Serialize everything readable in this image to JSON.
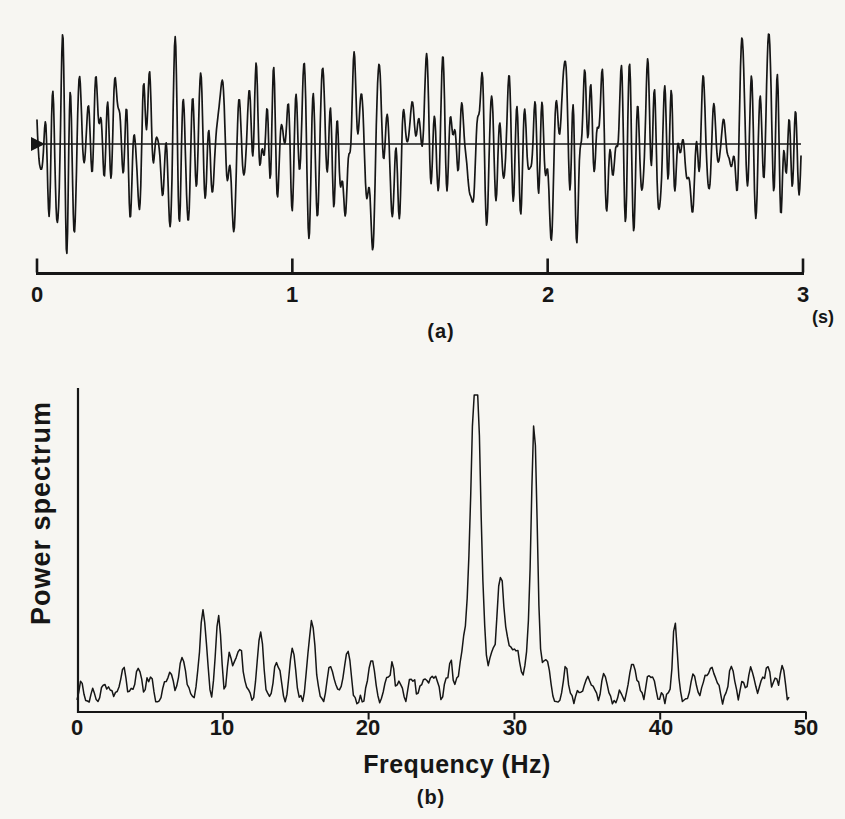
{
  "figure": {
    "bg_color": "#f7f6f2",
    "ink_color": "#161616"
  },
  "panel_a": {
    "caption": "(a)",
    "axis": {
      "unit_label": "(s)",
      "tick_labels": [
        "0",
        "1",
        "2",
        "3"
      ]
    }
  },
  "panel_b": {
    "caption": "(b)",
    "xlabel": "Frequency (Hz)",
    "ylabel": "Power spectrum",
    "tick_labels": [
      "0",
      "10",
      "20",
      "30",
      "40",
      "50"
    ]
  },
  "chart_data": [
    {
      "id": "time-signal",
      "type": "line",
      "title": "",
      "xlabel": "(s)",
      "ylabel": "",
      "xlim": [
        0,
        3
      ],
      "xticks": [
        0,
        1,
        2,
        3
      ],
      "grid": false,
      "description": "Dense zero-mean noisy oscillatory trace (EEG-like raw signal) drawn about a horizontal baseline with a small solid start arrowhead at t=0; duration 3 s",
      "synthesis": {
        "seed": 1234567,
        "peak_abs_px": 110,
        "components": [
          {
            "f": 27.35,
            "a": 1.0
          },
          {
            "f": 31.35,
            "a": 0.85
          },
          {
            "f": 29.15,
            "a": 0.45
          },
          {
            "f": 28.9,
            "a": 0.35
          },
          {
            "f": 29.7,
            "a": 0.3
          },
          {
            "f": 8.65,
            "a": 0.5
          },
          {
            "f": 9.7,
            "a": 0.42
          },
          {
            "f": 11.2,
            "a": 0.36
          },
          {
            "f": 12.6,
            "a": 0.4
          },
          {
            "f": 16.1,
            "a": 0.45
          },
          {
            "f": 14.8,
            "a": 0.3
          },
          {
            "f": 20.2,
            "a": 0.3
          },
          {
            "f": 41.0,
            "a": 0.42
          },
          {
            "f": 38.1,
            "a": 0.3
          },
          {
            "f": 7.3,
            "a": 0.28
          },
          {
            "f": 3.2,
            "a": 0.25
          },
          {
            "f": 25.6,
            "a": 0.25
          },
          {
            "f": 44.9,
            "a": 0.28
          },
          {
            "f": 5.0,
            "a": 0.2
          },
          {
            "f": 47.4,
            "a": 0.2
          }
        ],
        "broadband_noise": {
          "n": 60,
          "fmin": 1.0,
          "fmax": 47.0,
          "amp": 0.22
        }
      }
    },
    {
      "id": "power-spectrum",
      "type": "line",
      "title": "",
      "xlabel": "Frequency (Hz)",
      "ylabel": "Power spectrum",
      "xlim": [
        0,
        50
      ],
      "xticks": [
        0,
        10,
        20,
        30,
        40,
        50
      ],
      "ylim_note": "arbitrary units, no y tick labels shown",
      "grid": false,
      "dominant_peaks_hz": [
        27.35,
        31.35
      ],
      "secondary_peaks_hz": [
        8.65,
        9.7,
        12.6,
        16.1,
        29.15,
        41.0
      ],
      "plot_height_px": 324,
      "peaks": [
        {
          "f": 0.3,
          "h": 22,
          "w": 0.18
        },
        {
          "f": 2.2,
          "h": 14,
          "w": 0.3
        },
        {
          "f": 3.2,
          "h": 26,
          "w": 0.3
        },
        {
          "f": 4.1,
          "h": 22,
          "w": 0.28
        },
        {
          "f": 5.0,
          "h": 18,
          "w": 0.3
        },
        {
          "f": 6.2,
          "h": 20,
          "w": 0.3
        },
        {
          "f": 7.3,
          "h": 32,
          "w": 0.35
        },
        {
          "f": 8.65,
          "h": 92,
          "w": 0.3
        },
        {
          "f": 9.7,
          "h": 72,
          "w": 0.28
        },
        {
          "f": 10.5,
          "h": 42,
          "w": 0.28
        },
        {
          "f": 11.2,
          "h": 55,
          "w": 0.28
        },
        {
          "f": 12.6,
          "h": 64,
          "w": 0.3
        },
        {
          "f": 13.7,
          "h": 38,
          "w": 0.3
        },
        {
          "f": 14.8,
          "h": 46,
          "w": 0.3
        },
        {
          "f": 16.1,
          "h": 80,
          "w": 0.33
        },
        {
          "f": 17.4,
          "h": 36,
          "w": 0.3
        },
        {
          "f": 18.6,
          "h": 26,
          "w": 0.3
        },
        {
          "f": 20.2,
          "h": 42,
          "w": 0.3
        },
        {
          "f": 21.6,
          "h": 30,
          "w": 0.3
        },
        {
          "f": 23.0,
          "h": 22,
          "w": 0.3
        },
        {
          "f": 24.3,
          "h": 26,
          "w": 0.28
        },
        {
          "f": 25.6,
          "h": 30,
          "w": 0.25
        },
        {
          "f": 26.6,
          "h": 28,
          "w": 0.3
        },
        {
          "f": 27.35,
          "h": 300,
          "w": 0.42
        },
        {
          "f": 27.35,
          "h": 55,
          "w": 1.0
        },
        {
          "f": 28.9,
          "h": 52,
          "w": 0.38
        },
        {
          "f": 29.15,
          "h": 72,
          "w": 0.35
        },
        {
          "f": 29.7,
          "h": 48,
          "w": 0.35
        },
        {
          "f": 30.2,
          "h": 36,
          "w": 0.28
        },
        {
          "f": 31.35,
          "h": 226,
          "w": 0.3
        },
        {
          "f": 31.35,
          "h": 40,
          "w": 0.7
        },
        {
          "f": 32.3,
          "h": 30,
          "w": 0.25
        },
        {
          "f": 33.5,
          "h": 22,
          "w": 0.3
        },
        {
          "f": 35.0,
          "h": 26,
          "w": 0.3
        },
        {
          "f": 36.2,
          "h": 22,
          "w": 0.3
        },
        {
          "f": 38.1,
          "h": 42,
          "w": 0.25
        },
        {
          "f": 39.3,
          "h": 24,
          "w": 0.3
        },
        {
          "f": 41.0,
          "h": 82,
          "w": 0.22
        },
        {
          "f": 42.3,
          "h": 26,
          "w": 0.3
        },
        {
          "f": 43.6,
          "h": 30,
          "w": 0.3
        },
        {
          "f": 44.9,
          "h": 38,
          "w": 0.3
        },
        {
          "f": 46.3,
          "h": 30,
          "w": 0.3
        },
        {
          "f": 47.4,
          "h": 34,
          "w": 0.25
        },
        {
          "f": 48.3,
          "h": 26,
          "w": 0.25
        }
      ],
      "noise_floor": {
        "seed": 424242,
        "base_px": 6,
        "var_px": 26
      }
    }
  ]
}
